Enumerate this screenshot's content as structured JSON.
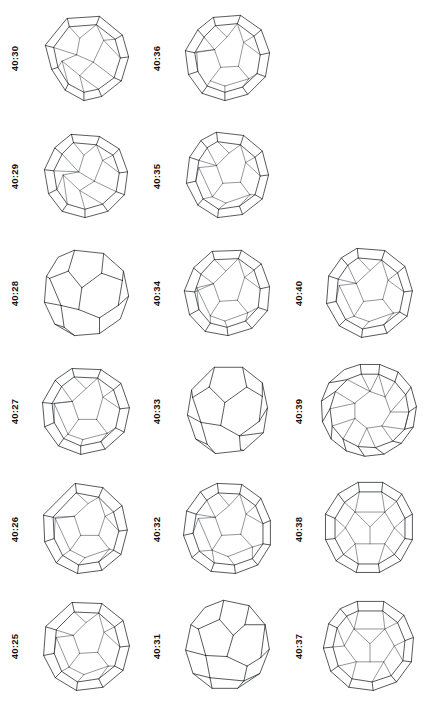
{
  "plate": {
    "kind": "polyhedron-catalog-plate",
    "orientation": "rotated-90-ccw",
    "background_color": "#ffffff",
    "ink_color": "#14161a",
    "rows": 6,
    "columns": 3,
    "figure_count": 16,
    "label_prefix": "40",
    "label_separator": ":"
  },
  "columns": [
    {
      "name": "column-left",
      "cells": [
        {
          "label": "40:30",
          "figure": "polyhedron-40-30",
          "style": "double-shell",
          "empty": false
        },
        {
          "label": "40:29",
          "figure": "polyhedron-40-29",
          "style": "double-shell",
          "empty": false
        },
        {
          "label": "40:28",
          "figure": "polyhedron-40-28",
          "style": "single-outline",
          "empty": false
        },
        {
          "label": "40:27",
          "figure": "polyhedron-40-27",
          "style": "double-shell",
          "empty": false
        },
        {
          "label": "40:26",
          "figure": "polyhedron-40-26",
          "style": "double-shell",
          "empty": false
        },
        {
          "label": "40:25",
          "figure": "polyhedron-40-25",
          "style": "double-shell",
          "empty": false
        }
      ]
    },
    {
      "name": "column-middle",
      "cells": [
        {
          "label": "40:36",
          "figure": "polyhedron-40-36",
          "style": "double-shell",
          "empty": false
        },
        {
          "label": "40:35",
          "figure": "polyhedron-40-35",
          "style": "double-shell",
          "empty": false
        },
        {
          "label": "40:34",
          "figure": "polyhedron-40-34",
          "style": "double-shell",
          "empty": false
        },
        {
          "label": "40:33",
          "figure": "polyhedron-40-33",
          "style": "single-outline",
          "empty": false
        },
        {
          "label": "40:32",
          "figure": "polyhedron-40-32",
          "style": "double-shell",
          "empty": false
        },
        {
          "label": "40:31",
          "figure": "polyhedron-40-31",
          "style": "single-outline",
          "empty": false
        }
      ]
    },
    {
      "name": "column-right",
      "cells": [
        {
          "label": "",
          "figure": "",
          "style": "none",
          "empty": true
        },
        {
          "label": "",
          "figure": "",
          "style": "none",
          "empty": true
        },
        {
          "label": "40:40",
          "figure": "polyhedron-40-40",
          "style": "double-shell",
          "empty": false
        },
        {
          "label": "40:39",
          "figure": "polyhedron-40-39",
          "style": "double-shell",
          "empty": false
        },
        {
          "label": "40:38",
          "figure": "polyhedron-40-38",
          "style": "double-shell",
          "empty": false
        },
        {
          "label": "40:37",
          "figure": "polyhedron-40-37",
          "style": "double-shell",
          "empty": false
        }
      ]
    }
  ]
}
